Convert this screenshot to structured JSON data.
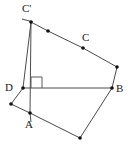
{
  "figure": {
    "canvas": {
      "width": 128,
      "height": 149,
      "background": "#ffffff"
    },
    "style": {
      "stroke_color": "#4a4a4a",
      "light_stroke_color": "#8a8a8a",
      "vertex_color": "#101010",
      "label_color": "#1a1a1a",
      "stroke_width": 1,
      "vertex_radius": 1.8
    },
    "labels": [
      {
        "id": "label-c-prime",
        "text": "C'",
        "x": 22,
        "y": 3
      },
      {
        "id": "label-c",
        "text": "C",
        "x": 82,
        "y": 32
      },
      {
        "id": "label-b",
        "text": "B",
        "x": 116,
        "y": 83
      },
      {
        "id": "label-d",
        "text": "D",
        "x": 5,
        "y": 82
      },
      {
        "id": "label-a",
        "text": "A",
        "x": 25,
        "y": 119
      }
    ],
    "points": [
      {
        "id": "point-c-prime",
        "name": "C'",
        "x": 31,
        "y": 22
      },
      {
        "id": "point-inner-top",
        "name": "inner-top",
        "x": 48,
        "y": 31
      },
      {
        "id": "point-c",
        "name": "C",
        "x": 83,
        "y": 48
      },
      {
        "id": "point-outer-right",
        "name": "outer-right",
        "x": 117,
        "y": 67
      },
      {
        "id": "point-b",
        "name": "B",
        "x": 112,
        "y": 88
      },
      {
        "id": "point-bottom",
        "name": "bottom",
        "x": 80,
        "y": 138
      },
      {
        "id": "point-a",
        "name": "A",
        "x": 30,
        "y": 113
      },
      {
        "id": "point-left",
        "name": "left",
        "x": 11,
        "y": 104
      },
      {
        "id": "point-d",
        "name": "D",
        "x": 23,
        "y": 88
      }
    ],
    "segments": [
      {
        "id": "seg-cprime-inner",
        "from": "C'",
        "to": "inner-top",
        "x1": 31,
        "y1": 22,
        "x2": 48,
        "y2": 31
      },
      {
        "id": "seg-inner-c",
        "from": "inner-top",
        "to": "C",
        "x1": 48,
        "y1": 31,
        "x2": 83,
        "y2": 48
      },
      {
        "id": "seg-c-outer",
        "from": "C",
        "to": "outer-right",
        "x1": 83,
        "y1": 48,
        "x2": 117,
        "y2": 67
      },
      {
        "id": "seg-outer-b",
        "from": "outer-right",
        "to": "B",
        "x1": 117,
        "y1": 67,
        "x2": 112,
        "y2": 88
      },
      {
        "id": "seg-b-bottom",
        "from": "B",
        "to": "bottom",
        "x1": 112,
        "y1": 88,
        "x2": 80,
        "y2": 138
      },
      {
        "id": "seg-bottom-a",
        "from": "bottom",
        "to": "A",
        "x1": 80,
        "y1": 138,
        "x2": 30,
        "y2": 113
      },
      {
        "id": "seg-a-left",
        "from": "A",
        "to": "left",
        "x1": 30,
        "y1": 113,
        "x2": 11,
        "y2": 104
      },
      {
        "id": "seg-left-d",
        "from": "left",
        "to": "D",
        "x1": 11,
        "y1": 104,
        "x2": 23,
        "y2": 88
      },
      {
        "id": "seg-d-cprime",
        "from": "D",
        "to": "C'",
        "x1": 23,
        "y1": 88,
        "x2": 31,
        "y2": 22
      },
      {
        "id": "seg-d-b",
        "from": "D",
        "to": "B",
        "x1": 23,
        "y1": 88,
        "x2": 112,
        "y2": 88
      },
      {
        "id": "seg-cprime-a",
        "from": "C'",
        "to": "A",
        "x1": 31,
        "y1": 22,
        "x2": 30,
        "y2": 113
      },
      {
        "id": "seg-cprime-tick",
        "from": "tick-left",
        "to": "C'",
        "x1": 22,
        "y1": 19,
        "x2": 33,
        "y2": 22
      },
      {
        "id": "seg-a-tick",
        "from": "A",
        "to": "tick-below",
        "x1": 30,
        "y1": 113,
        "x2": 31,
        "y2": 122
      }
    ],
    "right_angle_marker": {
      "id": "right-angle-at-d",
      "vertex": "D",
      "path": "M 31 88 L 31 77 L 42 77 L 42 88"
    }
  }
}
